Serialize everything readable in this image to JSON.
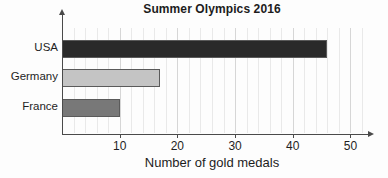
{
  "chart_data": {
    "type": "bar",
    "orientation": "horizontal",
    "title": "Summer Olympics 2016",
    "xlabel": "Number of gold medals",
    "ylabel": "",
    "categories": [
      "USA",
      "Germany",
      "France"
    ],
    "values": [
      46,
      17,
      10
    ],
    "bar_colors": [
      "#2a2a2a",
      "#c4c4c4",
      "#787878"
    ],
    "bar_edge_color": "#5a5a5a",
    "xlim": [
      0,
      52
    ],
    "xticks": [
      10,
      20,
      30,
      40,
      50
    ],
    "xtick_labels": [
      "10",
      "20",
      "30",
      "40",
      "50"
    ],
    "minor_tick_step": 2,
    "grid": true,
    "grid_axis": "x",
    "grid_color": "#e9e9e9",
    "legend": false,
    "legend_position": "none",
    "axis_color": "#4a4a4a",
    "background_color": "#fdfdfd",
    "text_color": "#1f1f1f"
  }
}
